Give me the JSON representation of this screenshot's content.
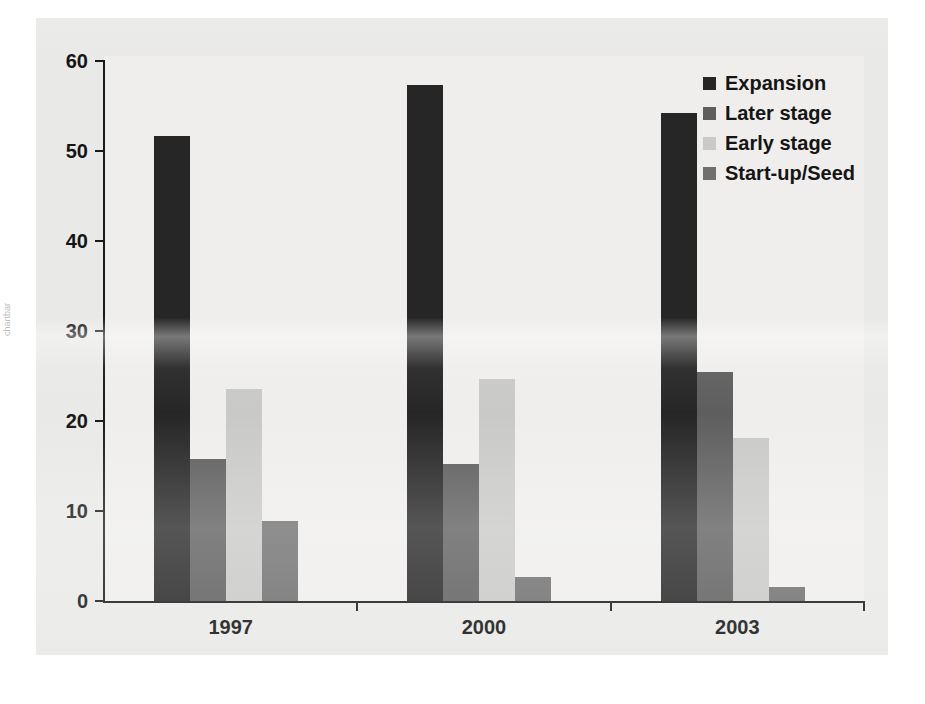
{
  "chart_data": {
    "type": "bar",
    "title": "",
    "subtitle": "",
    "xlabel": "",
    "ylabel": "",
    "categories": [
      "1997",
      "2000",
      "2003"
    ],
    "series": [
      {
        "name": "Expansion",
        "color": "#262626",
        "values": [
          51.7,
          57.3,
          54.2
        ]
      },
      {
        "name": "Later stage",
        "color": "#5e5e5e",
        "values": [
          15.8,
          15.2,
          25.4
        ]
      },
      {
        "name": "Early stage",
        "color": "#c9c9c7",
        "values": [
          23.6,
          24.7,
          18.1
        ]
      },
      {
        "name": "Start-up/Seed",
        "color": "#6f6f6f",
        "values": [
          8.9,
          2.7,
          1.6
        ]
      }
    ],
    "ylim": [
      0,
      60
    ],
    "yticks": [
      0,
      10,
      20,
      30,
      40,
      50,
      60
    ],
    "ytick_labels": [
      "0",
      "10",
      "20",
      "30",
      "40",
      "50",
      "60"
    ],
    "xtick_labels": [
      "1997",
      "2000",
      "2003"
    ],
    "grid": false,
    "legend_position": "top-right",
    "legend_entries": [
      "Expansion",
      "Later stage",
      "Early stage",
      "Start-up/Seed"
    ]
  },
  "colors": {
    "page_background": "#ffffff",
    "panel_background": "#e9e9e7",
    "plot_background": "#efeeec",
    "axis": "#1a1a1a",
    "text": "#151515"
  },
  "margin_artifact": "chartbar"
}
